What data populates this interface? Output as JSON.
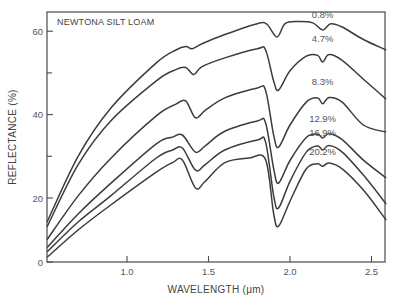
{
  "chart_data": {
    "type": "line",
    "title": "NEWTONA SILT LOAM",
    "xlabel": "WAVELENGTH (μm)",
    "ylabel": "REFLECTANCE (%)",
    "xlim": [
      0.51,
      2.59
    ],
    "ylim": [
      0,
      64.6
    ],
    "xticks": [
      1.0,
      1.5,
      2.0,
      2.5
    ],
    "xtick_labels": [
      "1.0",
      "1.5",
      "2.0",
      "2.5"
    ],
    "yticks_major": [
      0,
      20,
      40,
      60
    ],
    "ytick_labels": [
      "0",
      "20",
      "40",
      "60"
    ],
    "yticks_minor": [
      30,
      50
    ],
    "grid": false,
    "legend": "inline labels near 2.2 μm",
    "series": [
      {
        "name": "0.8%",
        "x": [
          0.51,
          0.7,
          0.9,
          1.18,
          1.3,
          1.36,
          1.4,
          1.46,
          1.6,
          1.8,
          1.86,
          1.92,
          1.97,
          2.05,
          2.14,
          2.2,
          2.25,
          2.32,
          2.45,
          2.59
        ],
        "y": [
          12.5,
          30.0,
          41.5,
          52.4,
          55.5,
          56.3,
          55.8,
          57.0,
          59.2,
          61.8,
          61.6,
          58.6,
          61.8,
          62.3,
          62.0,
          60.3,
          61.8,
          61.0,
          58.0,
          55.5
        ]
      },
      {
        "name": "4.7%",
        "x": [
          0.51,
          0.7,
          0.9,
          1.18,
          1.3,
          1.36,
          1.41,
          1.46,
          1.6,
          1.8,
          1.85,
          1.9,
          1.93,
          2.0,
          2.1,
          2.17,
          2.2,
          2.24,
          2.32,
          2.45,
          2.59
        ],
        "y": [
          11.0,
          28.0,
          38.5,
          48.1,
          50.8,
          51.3,
          49.6,
          51.5,
          53.6,
          55.8,
          55.5,
          48.0,
          45.9,
          50.5,
          54.0,
          54.2,
          52.6,
          54.4,
          53.0,
          48.5,
          43.7
        ]
      },
      {
        "name": "8.3%",
        "x": [
          0.51,
          0.7,
          0.9,
          1.18,
          1.3,
          1.36,
          1.42,
          1.48,
          1.6,
          1.8,
          1.85,
          1.9,
          1.93,
          2.0,
          2.1,
          2.17,
          2.2,
          2.24,
          2.32,
          2.45,
          2.59
        ],
        "y": [
          7.0,
          20.5,
          29.5,
          39.7,
          42.5,
          43.3,
          39.2,
          41.0,
          44.0,
          46.4,
          45.8,
          35.0,
          32.2,
          37.5,
          43.0,
          44.0,
          42.6,
          44.1,
          43.0,
          37.5,
          35.8
        ]
      },
      {
        "name": "12.9%",
        "x": [
          0.51,
          0.7,
          0.9,
          1.18,
          1.28,
          1.34,
          1.42,
          1.48,
          1.6,
          1.8,
          1.85,
          1.9,
          1.93,
          2.0,
          2.1,
          2.17,
          2.2,
          2.24,
          2.32,
          2.45,
          2.59
        ],
        "y": [
          4.5,
          15.0,
          23.5,
          33.0,
          34.6,
          35.1,
          31.0,
          32.5,
          36.0,
          38.5,
          38.0,
          27.0,
          23.6,
          29.0,
          34.5,
          35.3,
          34.4,
          35.4,
          34.0,
          29.1,
          24.8
        ]
      },
      {
        "name": "16.9%",
        "x": [
          0.51,
          0.7,
          0.9,
          1.18,
          1.28,
          1.34,
          1.42,
          1.48,
          1.6,
          1.8,
          1.85,
          1.9,
          1.93,
          2.0,
          2.1,
          2.17,
          2.2,
          2.24,
          2.32,
          2.45,
          2.59
        ],
        "y": [
          3.2,
          12.5,
          20.5,
          29.6,
          31.5,
          32.0,
          26.7,
          28.0,
          31.5,
          33.9,
          33.4,
          20.5,
          16.9,
          24.0,
          31.0,
          32.5,
          31.5,
          32.6,
          31.0,
          25.5,
          18.1
        ]
      },
      {
        "name": "20.2%",
        "x": [
          0.51,
          0.7,
          0.9,
          1.18,
          1.28,
          1.34,
          1.42,
          1.48,
          1.6,
          1.75,
          1.85,
          1.9,
          1.93,
          2.0,
          2.1,
          2.17,
          2.2,
          2.24,
          2.32,
          2.45,
          2.59
        ],
        "y": [
          1.5,
          10.0,
          17.8,
          26.2,
          28.5,
          29.1,
          22.4,
          24.0,
          28.5,
          29.6,
          29.2,
          15.0,
          11.2,
          19.0,
          27.0,
          28.2,
          27.6,
          28.4,
          27.0,
          21.9,
          13.1
        ]
      }
    ],
    "series_label_positions": [
      {
        "label": "0.8%",
        "x": 2.2,
        "y": 63.2
      },
      {
        "label": "4.7%",
        "x": 2.2,
        "y": 57.5
      },
      {
        "label": "8.3%",
        "x": 2.2,
        "y": 47.0
      },
      {
        "label": "12.9%",
        "x": 2.2,
        "y": 38.3
      },
      {
        "label": "16.9%",
        "x": 2.2,
        "y": 34.8
      },
      {
        "label": "20.2%",
        "x": 2.2,
        "y": 30.2
      }
    ]
  }
}
